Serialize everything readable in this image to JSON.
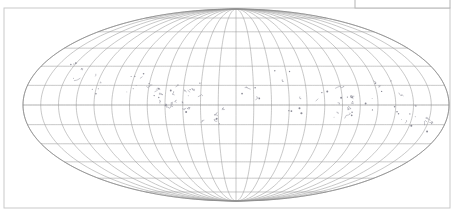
{
  "figure": {
    "type": "map-projection-figure",
    "projection": "mollweide",
    "background_color": "#ffffff",
    "frame": {
      "name": "figure-frame",
      "x": 4,
      "y": 8,
      "width": 446,
      "height": 200,
      "stroke_color": "#c9c9c9"
    },
    "legend_box": {
      "name": "legend-box",
      "x": 355,
      "y": -6,
      "width": 95,
      "height": 14,
      "stroke_color": "#b4b4b4",
      "fill_color": "#ffffff",
      "label": ""
    }
  },
  "chart_data": {
    "type": "map",
    "title": "",
    "subtitle": "",
    "xlabel": "",
    "ylabel": "",
    "projection": "Mollweide (elliptical equal-area)",
    "central_meridian": 180,
    "grid": true,
    "legend_position": "top-right",
    "graticule": {
      "meridian_interval_deg": 15,
      "parallel_interval_deg": 15,
      "meridians_deg": [
        -180,
        -165,
        -150,
        -135,
        -120,
        -105,
        -90,
        -75,
        -60,
        -45,
        -30,
        -15,
        0,
        15,
        30,
        45,
        60,
        75,
        90,
        105,
        120,
        135,
        150,
        165,
        180
      ],
      "parallels_deg": [
        -75,
        -60,
        -45,
        -30,
        -15,
        0,
        15,
        30,
        45,
        60,
        75
      ],
      "stroke_color": "#9a9a9a"
    },
    "ellipse": {
      "center_x": 236,
      "center_y": 105,
      "semi_axis_x": 213,
      "semi_axis_y": 96,
      "outline_color": "#8a8a8a"
    },
    "features": {
      "coastline_color": "#8b8b96",
      "description": "sparse Pacific island coastlines and scattered island groups",
      "island_clusters": [
        {
          "name": "cluster-west-a",
          "cx": 78,
          "cy": 72,
          "n": 6
        },
        {
          "name": "cluster-west-b",
          "cx": 96,
          "cy": 86,
          "n": 5
        },
        {
          "name": "cluster-indonesia",
          "cx": 138,
          "cy": 82,
          "n": 9
        },
        {
          "name": "cluster-melanesia",
          "cx": 166,
          "cy": 96,
          "n": 12
        },
        {
          "name": "cluster-newguinea",
          "cx": 178,
          "cy": 108,
          "n": 10
        },
        {
          "name": "cluster-micronesia",
          "cx": 196,
          "cy": 88,
          "n": 7
        },
        {
          "name": "cluster-polynesia-w",
          "cx": 214,
          "cy": 116,
          "n": 6
        },
        {
          "name": "cluster-central-pacific",
          "cx": 252,
          "cy": 94,
          "n": 5
        },
        {
          "name": "cluster-hawaii",
          "cx": 286,
          "cy": 78,
          "n": 4
        },
        {
          "name": "cluster-line-islands",
          "cx": 300,
          "cy": 104,
          "n": 5
        },
        {
          "name": "cluster-marquesas",
          "cx": 330,
          "cy": 98,
          "n": 6
        },
        {
          "name": "cluster-society",
          "cx": 344,
          "cy": 112,
          "n": 7
        },
        {
          "name": "cluster-tuamotu",
          "cx": 360,
          "cy": 104,
          "n": 9
        },
        {
          "name": "cluster-east-a",
          "cx": 386,
          "cy": 90,
          "n": 6
        },
        {
          "name": "cluster-east-b",
          "cx": 404,
          "cy": 116,
          "n": 8
        },
        {
          "name": "cluster-southeast",
          "cx": 418,
          "cy": 126,
          "n": 5
        }
      ]
    }
  }
}
